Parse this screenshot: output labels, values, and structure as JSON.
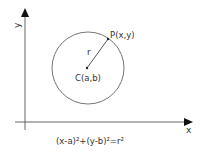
{
  "diagram": {
    "axes": {
      "x_label": "x",
      "y_label": "y"
    },
    "center_label": "C(a,b)",
    "point_label": "P(x,y)",
    "radius_label": "r",
    "equation": "(x-a)²+(y-b)²=r²",
    "colors": {
      "stroke": "#555555",
      "text": "#333333",
      "background": "#ffffff"
    }
  }
}
